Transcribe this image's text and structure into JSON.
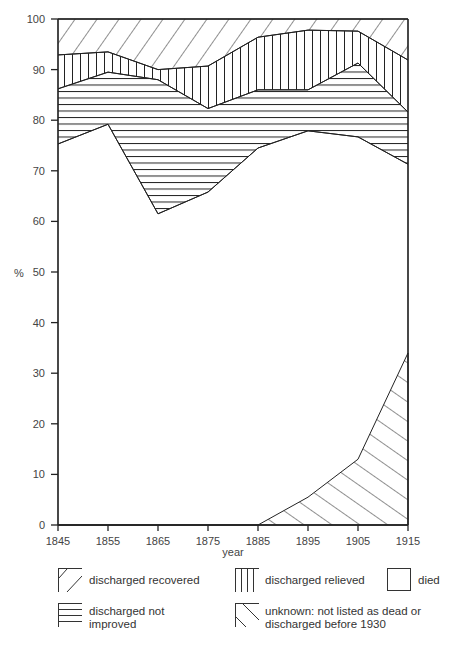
{
  "chart_data": {
    "type": "area",
    "title": "",
    "xlabel": "year",
    "ylabel": "%",
    "xlim": [
      1845,
      1915
    ],
    "ylim": [
      0,
      100
    ],
    "x": [
      1845,
      1855,
      1865,
      1875,
      1885,
      1895,
      1905,
      1915
    ],
    "x_ticks": [
      "1845",
      "1855",
      "1865",
      "1875",
      "1885",
      "1895",
      "1905",
      "1915"
    ],
    "y_ticks": [
      "0",
      "10",
      "20",
      "30",
      "40",
      "50",
      "60",
      "70",
      "80",
      "90",
      "100"
    ],
    "stacked_boundaries": {
      "died_top": [
        75.3,
        79.2,
        61.5,
        65.8,
        74.5,
        77.9,
        76.7,
        71.3
      ],
      "not_improved_top": [
        86.2,
        89.5,
        88.0,
        82.3,
        86.0,
        86.0,
        91.3,
        81.6
      ],
      "relieved_top": [
        92.9,
        93.5,
        90.0,
        90.7,
        96.4,
        97.8,
        97.6,
        91.9
      ],
      "recovered_top": [
        100,
        100,
        100,
        100,
        100,
        100,
        100,
        100
      ],
      "unknown_top": [
        0,
        0,
        0,
        0,
        0,
        5.5,
        13.0,
        34.0
      ]
    },
    "series": [
      {
        "name": "died",
        "values": [
          75.3,
          79.2,
          61.5,
          65.8,
          74.5,
          77.9,
          76.7,
          71.3
        ]
      },
      {
        "name": "discharged not improved",
        "values": [
          10.9,
          10.3,
          26.5,
          16.5,
          11.5,
          8.1,
          14.6,
          10.3
        ]
      },
      {
        "name": "discharged relieved",
        "values": [
          6.7,
          4.0,
          2.0,
          8.4,
          10.4,
          11.8,
          6.3,
          10.3
        ]
      },
      {
        "name": "discharged recovered",
        "values": [
          7.1,
          6.5,
          10.0,
          9.3,
          3.6,
          2.2,
          2.4,
          8.1
        ]
      },
      {
        "name": "unknown: not listed as dead or discharged before 1930",
        "values": [
          0,
          0,
          0,
          0,
          0,
          5.5,
          13.0,
          34.0
        ]
      }
    ],
    "legend": [
      {
        "label": "discharged recovered",
        "pattern": "diagonal-forward"
      },
      {
        "label": "discharged relieved",
        "pattern": "vertical"
      },
      {
        "label": "died",
        "pattern": "blank"
      },
      {
        "label": "discharged not improved",
        "pattern": "horizontal"
      },
      {
        "label": "unknown: not listed as dead or discharged before 1930",
        "pattern": "diagonal-backward"
      }
    ],
    "grid": false,
    "legend_position": "bottom"
  },
  "axis": {
    "y_label": "%",
    "x_label": "year"
  },
  "legend": {
    "recovered": "discharged recovered",
    "relieved": "discharged relieved",
    "died": "died",
    "not_improved_line1": "discharged not",
    "not_improved_line2": "improved",
    "unknown_line1": "unknown: not listed as dead or",
    "unknown_line2": "discharged before 1930"
  },
  "colors": {
    "line": "#222222",
    "background": "#ffffff"
  }
}
